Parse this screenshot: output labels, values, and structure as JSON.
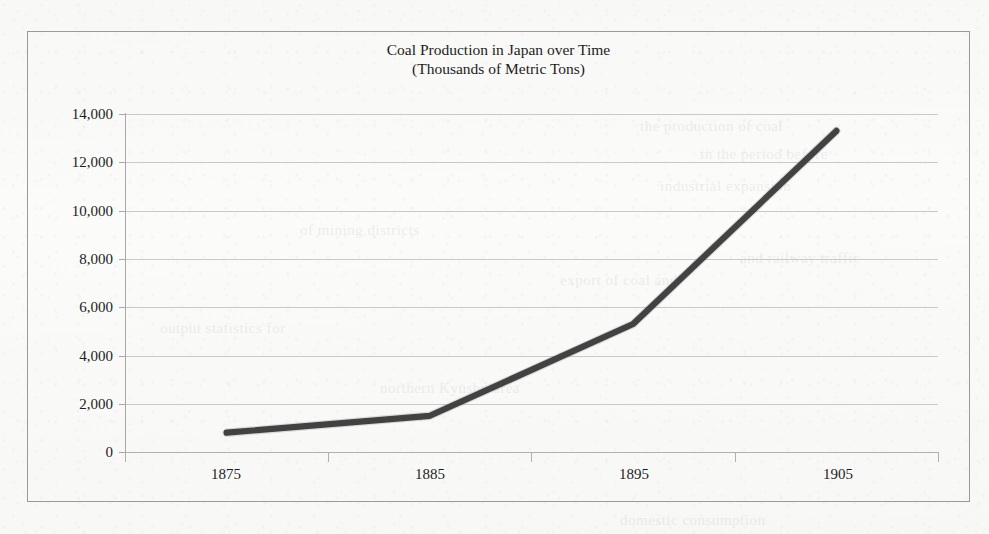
{
  "chart_data": {
    "type": "line",
    "title": "Coal Production in Japan over Time",
    "subtitle": "(Thousands of Metric Tons)",
    "title_lines": [
      "Coal Production in Japan over Time",
      "(Thousands of Metric Tons)"
    ],
    "xlabel": "",
    "ylabel": "",
    "categories": [
      "1875",
      "1885",
      "1895",
      "1905"
    ],
    "values": [
      800,
      1500,
      5300,
      13300
    ],
    "series": [
      {
        "name": "Coal Production",
        "values": [
          800,
          1500,
          5300,
          13300
        ]
      }
    ],
    "ylim": [
      0,
      14000
    ],
    "y_ticks": [
      0,
      2000,
      4000,
      6000,
      8000,
      10000,
      12000,
      14000
    ],
    "y_tick_labels": [
      "0",
      "2,000",
      "4,000",
      "6,000",
      "8,000",
      "10,000",
      "12,000",
      "14,000"
    ],
    "x_tick_labels": [
      "1875",
      "1885",
      "1895",
      "1905"
    ],
    "grid": "horizontal",
    "legend": "none",
    "line_color": "#3a3a3a",
    "grid_color": "#c9c9c9",
    "axis_color": "#a8a8a8",
    "border_color": "#9a9a9a",
    "text_color": "#1d1d1d",
    "background_color": "#fbfbfa"
  },
  "page": {
    "bleed_through_lines": [
      "the production of coal",
      "in the period before",
      "industrial expansion",
      "of mining districts",
      "and railway traffic",
      "export of coal and",
      "output statistics for",
      "northern Kyushu area",
      "domestic consumption"
    ]
  }
}
